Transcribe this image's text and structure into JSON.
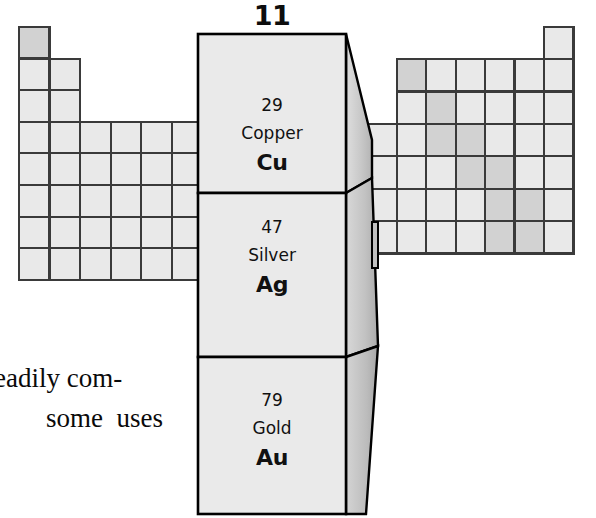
{
  "figure": {
    "kind": "periodic-table-group-highlight",
    "group_number": "11",
    "elements": [
      {
        "atomic_number": "29",
        "name": "Copper",
        "symbol": "Cu"
      },
      {
        "atomic_number": "47",
        "name": "Silver",
        "symbol": "Ag"
      },
      {
        "atomic_number": "79",
        "name": "Gold",
        "symbol": "Au"
      }
    ]
  },
  "caption": {
    "line_1": "eadily com-",
    "line_2": "some  uses"
  },
  "colors": {
    "cell_light": "#e9e9e9",
    "cell_mid": "#d2d2d2",
    "cell_dark": "#bdbdbd",
    "grid_stroke": "#3a3a3a",
    "front_face": "#eaeaea",
    "outline": "#000000",
    "text": "#111111",
    "background": "#ffffff"
  },
  "left_grid": {
    "description": "left wing of the periodic table, groups 1-2 and 3-7 transition block",
    "origin_x": 19,
    "origin_y": 27,
    "cell_w": 30.6,
    "cell_h": 31.6,
    "rows": [
      {
        "row": 1,
        "start_col": 0,
        "count": 1,
        "shades": [
          "mid"
        ]
      },
      {
        "row": 2,
        "start_col": 0,
        "count": 2,
        "shades": [
          "light",
          "light"
        ]
      },
      {
        "row": 3,
        "start_col": 0,
        "count": 2,
        "shades": [
          "light",
          "light"
        ]
      },
      {
        "row": 4,
        "start_col": 0,
        "count": 6,
        "shades": [
          "light",
          "light",
          "light",
          "light",
          "light",
          "light"
        ]
      },
      {
        "row": 5,
        "start_col": 0,
        "count": 6,
        "shades": [
          "light",
          "light",
          "light",
          "light",
          "light",
          "light"
        ]
      },
      {
        "row": 6,
        "start_col": 0,
        "count": 6,
        "shades": [
          "light",
          "light",
          "light",
          "light",
          "light",
          "light"
        ]
      },
      {
        "row": 7,
        "start_col": 0,
        "count": 6,
        "shades": [
          "light",
          "light",
          "light",
          "light",
          "light",
          "light"
        ]
      }
    ]
  },
  "right_grid": {
    "description": "right wing of the periodic table, groups 12-18 with metalloid staircase shaded darker",
    "origin_x": 397,
    "origin_y": 59,
    "cell_w": 29.4,
    "cell_h": 32.4,
    "helium_cell": {
      "col": 5,
      "row": -1,
      "shade": "light"
    },
    "rows": [
      {
        "row": 0,
        "start_col": 0,
        "count": 6,
        "shades": [
          "mid",
          "light",
          "light",
          "light",
          "light",
          "light"
        ]
      },
      {
        "row": 1,
        "start_col": 0,
        "count": 6,
        "shades": [
          "light",
          "mid",
          "light",
          "light",
          "light",
          "light"
        ]
      },
      {
        "row": 2,
        "start_col": -1,
        "count": 7,
        "shades": [
          "light",
          "light",
          "mid",
          "mid",
          "light",
          "light",
          "light"
        ]
      },
      {
        "row": 3,
        "start_col": -1,
        "count": 7,
        "shades": [
          "light",
          "light",
          "light",
          "mid",
          "mid",
          "light",
          "light"
        ]
      },
      {
        "row": 4,
        "start_col": -1,
        "count": 7,
        "shades": [
          "light",
          "light",
          "light",
          "light",
          "mid",
          "mid",
          "light"
        ]
      }
    ]
  },
  "center_column": {
    "front_left": 198,
    "front_right": 346,
    "cells": [
      {
        "top": 34,
        "bottom": 193
      },
      {
        "top": 193,
        "bottom": 357
      },
      {
        "top": 357,
        "bottom": 514
      }
    ]
  }
}
